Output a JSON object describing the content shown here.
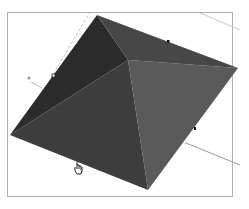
{
  "canvas": {
    "model": "pyramid",
    "faces": {
      "left": "#2b2b2b",
      "bottom_left": "#3d3d3d",
      "bottom_right": "#5a5a5a",
      "top": "#464646"
    },
    "apex": [
      128,
      60
    ],
    "base": {
      "top": [
        97,
        15
      ],
      "right": [
        238,
        68
      ],
      "bottom": [
        148,
        190
      ],
      "left": [
        10,
        135
      ]
    },
    "guide_color": "#b8b8b8",
    "cursor_icon": "hand-pointer"
  },
  "status_bar": {
    "text": ""
  }
}
